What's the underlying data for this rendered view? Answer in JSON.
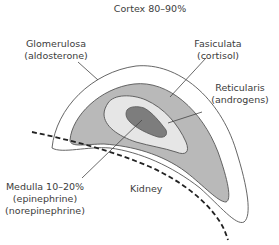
{
  "title": "Cortex 80–90%",
  "labels": {
    "glomerulosa": {
      "name": "Glomerulosa",
      "hormone": "(aldosterone)"
    },
    "fasiculata": {
      "name": "Fasiculata",
      "hormone": "(cortisol)"
    },
    "reticularis": {
      "name": "Reticularis",
      "hormone": "(androgens)"
    },
    "medulla": {
      "name": "Medulla 10–20%",
      "hormone1": "(epinephrine)",
      "hormone2": "(norepinephrine)"
    },
    "kidney": "Kidney"
  },
  "colors": {
    "glomerulosa": "#ffffff",
    "fasiculata": "#b9b9b9",
    "reticularis": "#e6e6e6",
    "medulla": "#7d7d7d",
    "outline": "#444444"
  }
}
